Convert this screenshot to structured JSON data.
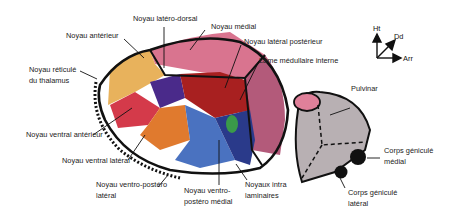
{
  "labels": {
    "noyau_anterieur": "Noyau antérieur",
    "noyau_latero_dorsal": "Noyau latéro-dorsal",
    "noyau_medial": "Noyau médial",
    "noyau_lateral_posterieur": "Noyau latéral postérieur",
    "lame_medullaire_interne": "Lame médullaire interne",
    "noyau_reticule_line1": "Noyau réticulé",
    "noyau_reticule_line2": "du thalamus",
    "noyau_ventral_anterieur": "Noyau ventral antérieur",
    "noyau_ventral_lateral": "Noyau ventral latéral",
    "noyau_vpl_line1": "Noyau ventro-postéro",
    "noyau_vpl_line2": "latéral",
    "noyau_vpm_line1": "Noyau ventro-",
    "noyau_vpm_line2": "postéro médial",
    "noyaux_intra_line1": "Noyaux intra",
    "noyaux_intra_line2": "laminaires",
    "pulvinar": "Pulvinar",
    "cgm_line1": "Corps géniculé",
    "cgm_line2": "médial",
    "cgl_line1": "Corps géniculé",
    "cgl_line2": "latéral"
  },
  "orientation": {
    "up": "Ht",
    "diagonal": "Dd",
    "right": "Arr"
  },
  "colors": {
    "anterieur": "#e8b25c",
    "medial": "#d9748f",
    "lateral_posterieur": "#b35a7a",
    "latero_dorsal": "#4a2a8a",
    "ventral_anterieur": "#d43a4a",
    "ventral_lateral": "#e07a2e",
    "vpl": "#4a72c0",
    "vpm": "#2a3a8a",
    "pulvinar_region": "#b8b0b3",
    "pulvinar_cap": "#e0809a",
    "dark_red": "#a82020",
    "green": "#3a9a4a",
    "outline": "#111111"
  }
}
